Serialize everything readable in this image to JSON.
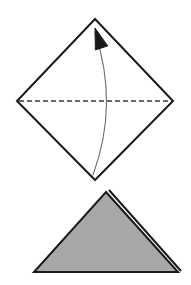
{
  "figure": {
    "kind": "origami-fold-diagram",
    "title": "",
    "canvas": {
      "width": 191,
      "height": 285,
      "background": "#ffffff"
    },
    "colors": {
      "outline": "#1a1a1a",
      "fold_line": "#3a3a3a",
      "arrow": "#6e6e6e",
      "arrowhead": "#1a1a1a",
      "paper_fill": "#a8a8a8",
      "paper_back": "#ffffff"
    },
    "steps": [
      {
        "step_name": "before-fold",
        "shape_name": "square-diamond",
        "label": "",
        "vertices": [
          {
            "name": "top",
            "x": 95,
            "y": 19
          },
          {
            "name": "right",
            "x": 173,
            "y": 101
          },
          {
            "name": "bottom",
            "x": 95,
            "y": 180
          },
          {
            "name": "left",
            "x": 17,
            "y": 101
          }
        ],
        "stroke_width": 2,
        "fill": "#ffffff",
        "fold_line": {
          "name": "horizontal-valley-fold",
          "x1": 19,
          "y1": 101,
          "x2": 171,
          "y2": 101,
          "dash": "5 3",
          "stroke_width": 1.6
        },
        "fold_arrow": {
          "name": "fold-up-arrow",
          "from_x": 93,
          "from_y": 175,
          "to_x": 95,
          "to_y": 31,
          "control_x": 119,
          "control_y": 104,
          "stroke_width": 1.1,
          "head_tip_x": 95,
          "head_tip_y": 28,
          "head_length": 21,
          "head_width": 13
        }
      },
      {
        "step_name": "after-fold",
        "shape_name": "folded-triangle",
        "label": "",
        "vertices": [
          {
            "name": "apex",
            "x": 106,
            "y": 192
          },
          {
            "name": "bottom-right",
            "x": 178,
            "y": 272
          },
          {
            "name": "bottom-left",
            "x": 34,
            "y": 272
          }
        ],
        "stroke_width": 2,
        "fill": "#a8a8a8",
        "flap_edge": {
          "name": "rear-flap-edge",
          "x1": 109,
          "y1": 190,
          "x2": 181,
          "y2": 271,
          "stroke_width": 2
        }
      }
    ]
  }
}
